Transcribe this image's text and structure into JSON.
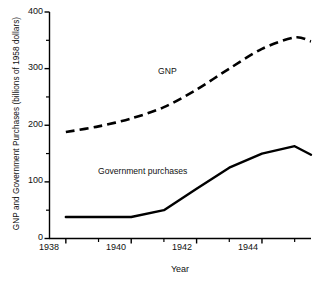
{
  "chart_data": {
    "type": "line",
    "title": "",
    "xlabel": "Year",
    "ylabel": "GNP and Government Purchases (billions of 1958 dollars)",
    "x": [
      1938,
      1939,
      1940,
      1941,
      1942,
      1943,
      1944,
      1945
    ],
    "xlim": [
      1937.5,
      1945.5
    ],
    "ylim": [
      0,
      400
    ],
    "grid": false,
    "legend_position": "inline-annotations",
    "x_tick_labels": [
      "1938",
      "1940",
      "1942",
      "1944"
    ],
    "x_major_ticks": [
      1938,
      1940,
      1942,
      1944
    ],
    "x_minor_ticks": [
      1939,
      1941,
      1943,
      1945
    ],
    "y_tick_labels": [
      "0",
      "100",
      "200",
      "300",
      "400"
    ],
    "y_major_ticks": [
      0,
      100,
      200,
      300,
      400
    ],
    "y_minor_ticks": [
      50,
      150,
      250,
      350
    ],
    "series": [
      {
        "name": "GNP",
        "style": "dashed",
        "color": "#000000",
        "annotation": "GNP",
        "values": [
          188,
          198,
          212,
          232,
          263,
          300,
          335,
          355
        ],
        "end_value": 348
      },
      {
        "name": "Government purchases",
        "style": "solid",
        "color": "#000000",
        "annotation": "Government purchases",
        "values": [
          38,
          38,
          38,
          50,
          88,
          125,
          150,
          163
        ],
        "end_value": 148
      }
    ]
  },
  "axes": {
    "y_title": "GNP and Government Purchases (billions of 1958 dollars)",
    "x_title": "Year",
    "y_labels": [
      "400",
      "300",
      "200",
      "100",
      "0"
    ],
    "x_labels": [
      "1938",
      "1940",
      "1942",
      "1944"
    ]
  },
  "annotations": {
    "gnp": "GNP",
    "government_purchases": "Government purchases"
  }
}
